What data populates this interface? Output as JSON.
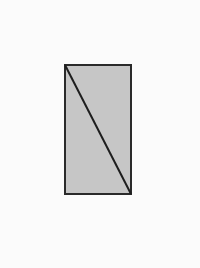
{
  "canvas": {
    "width": 200,
    "height": 268,
    "background": "#fbfbfb"
  },
  "shape": {
    "type": "rectangle",
    "x": 65,
    "y": 65,
    "width": 66,
    "height": 129,
    "fill": "#c6c6c6",
    "stroke": "#2a2a2a",
    "stroke_width": 2
  },
  "diagonal": {
    "x1": 65,
    "y1": 65,
    "x2": 131,
    "y2": 194,
    "stroke": "#1e1e1e",
    "stroke_width": 2
  }
}
